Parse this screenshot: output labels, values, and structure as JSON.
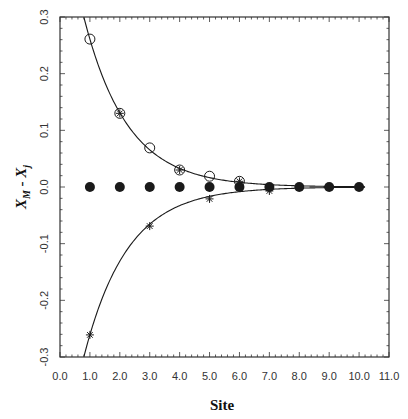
{
  "chart_data": {
    "type": "scatter",
    "title": "",
    "xlabel": "Site",
    "ylabel": "X_M - X_j",
    "ylabel_parts": {
      "a": "X",
      "a_sub": "M",
      "sep": " - ",
      "b": "X",
      "b_sub": "j"
    },
    "xlim": [
      0.0,
      11.0
    ],
    "ylim": [
      -0.3,
      0.3
    ],
    "grid": false,
    "legend": null,
    "x_ticks": [
      "0.0",
      "1.0",
      "2.0",
      "3.0",
      "4.0",
      "5.0",
      "6.0",
      "7.0",
      "8.0",
      "9.0",
      "10.0",
      "11.0"
    ],
    "y_ticks": [
      "-0.3",
      "-0.2",
      "-0.1",
      "0.0",
      "0.1",
      "0.2",
      "0.3"
    ],
    "series": [
      {
        "name": "filled circles",
        "marker": "filled-circle",
        "x": [
          1,
          2,
          3,
          4,
          5,
          6,
          7,
          8,
          9,
          10
        ],
        "y": [
          0,
          0,
          0,
          0,
          0,
          0,
          0,
          0,
          0,
          0
        ]
      },
      {
        "name": "open circles",
        "marker": "open-circle",
        "x": [
          1,
          2,
          3,
          4,
          5,
          6
        ],
        "y": [
          0.261,
          0.13,
          0.069,
          0.03,
          0.019,
          0.01
        ]
      },
      {
        "name": "stars",
        "marker": "star",
        "x": [
          1,
          2,
          3,
          4,
          5,
          6,
          7
        ],
        "y": [
          -0.261,
          0.13,
          -0.069,
          0.03,
          -0.021,
          0.01,
          -0.007
        ]
      },
      {
        "name": "upper fit curve",
        "marker": "line",
        "formula": "y = 0.52 * exp(-0.69 * x)",
        "x_range": [
          0.8,
          10.2
        ]
      },
      {
        "name": "lower fit curve",
        "marker": "line",
        "formula": "y = -0.52 * exp(-0.69 * x)",
        "x_range": [
          0.8,
          10.2
        ]
      }
    ]
  },
  "colors": {
    "ink": "#1a1a1a",
    "frame": "#333333",
    "background": "#ffffff"
  }
}
